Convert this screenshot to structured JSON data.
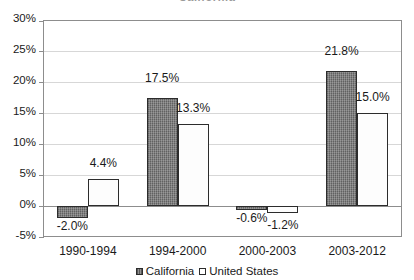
{
  "chart_data": {
    "type": "bar",
    "title": "California",
    "subtitle": "",
    "xlabel": "",
    "ylabel": "",
    "categories": [
      "1990-1994",
      "1994-2000",
      "2000-2003",
      "2003-2012"
    ],
    "series": [
      {
        "name": "California",
        "color": "#767676",
        "values": [
          -2.0,
          17.5,
          -0.6,
          21.8
        ],
        "labels": [
          "-2.0%",
          "17.5%",
          "-0.6%",
          "21.8%"
        ]
      },
      {
        "name": "United States",
        "color": "#ffffff",
        "values": [
          4.4,
          13.3,
          -1.2,
          15.0
        ],
        "labels": [
          "4.4%",
          "13.3%",
          "-1.2%",
          "15.0%"
        ]
      }
    ],
    "ylim": [
      -5,
      30
    ],
    "ytick_values": [
      30,
      25,
      20,
      15,
      10,
      5,
      0,
      -5
    ],
    "ytick_labels": [
      "30%",
      "25%",
      "20%",
      "15%",
      "10%",
      "5%",
      "0%",
      "-5%"
    ],
    "grid": true,
    "legend_position": "bottom",
    "legend": [
      "California",
      "United States"
    ]
  },
  "axis": {
    "y": {
      "ticks": [
        {
          "label": "30%",
          "value": 30
        },
        {
          "label": "25%",
          "value": 25
        },
        {
          "label": "20%",
          "value": 20
        },
        {
          "label": "15%",
          "value": 15
        },
        {
          "label": "10%",
          "value": 10
        },
        {
          "label": "5%",
          "value": 5
        },
        {
          "label": "0%",
          "value": 0
        },
        {
          "label": "-5%",
          "value": -5
        }
      ]
    },
    "x": {
      "ticks": [
        "1990-1994",
        "1994-2000",
        "2000-2003",
        "2003-2012"
      ]
    }
  },
  "legend": {
    "items": [
      {
        "label": "California",
        "swatch": "dark-hatched-square-icon"
      },
      {
        "label": "United States",
        "swatch": "white-square-icon"
      }
    ]
  }
}
